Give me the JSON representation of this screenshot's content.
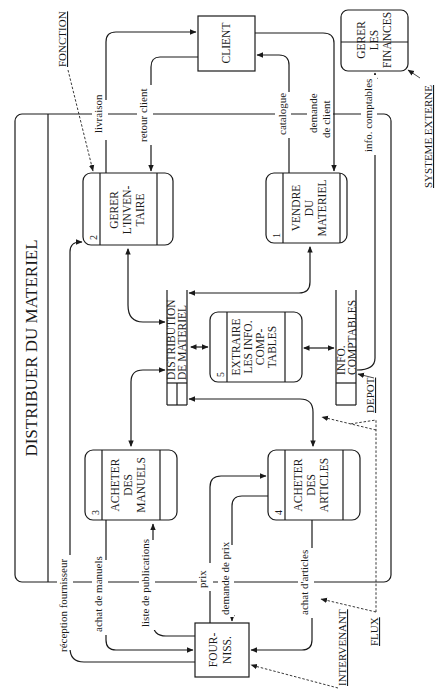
{
  "title": "DISTRIBUER DU MATERIEL",
  "entities": {
    "client": "CLIENT",
    "fournisseur": [
      "FOUR-",
      "NISS."
    ]
  },
  "external_process": [
    "GERER",
    "LES",
    "FINANCES"
  ],
  "processes": [
    {
      "num": "1",
      "lines": [
        "VENDRE",
        "DU",
        "MATERIEL"
      ]
    },
    {
      "num": "2",
      "lines": [
        "GERER",
        "L'INVEN-",
        "TAIRE"
      ]
    },
    {
      "num": "3",
      "lines": [
        "ACHETER",
        "DES",
        "MANUELS"
      ]
    },
    {
      "num": "4",
      "lines": [
        "ACHETER",
        "DES",
        "ARTICLES"
      ]
    },
    {
      "num": "5",
      "lines": [
        "EXTRAIRE",
        "LES INFO.",
        "COMP-",
        "TABLES"
      ]
    }
  ],
  "stores": {
    "distribution": [
      "DISTRIBUTION",
      "DE MATERIEL"
    ],
    "comptables": [
      "INFO.",
      "COMPTABLES"
    ]
  },
  "flows": {
    "livraison": "livraison",
    "retour_client": "retour client",
    "catalogue": "catalogue",
    "demande_client": [
      "demande",
      "de client"
    ],
    "info_comptables": "info. comptables",
    "reception_fournisseur": "réception fournisseur",
    "achat_manuels": "achat de manuels",
    "liste_publications": "liste de publications",
    "prix": "prix",
    "demande_prix": "demande de prix",
    "achat_articles": "achat d'articles"
  },
  "legend": {
    "fonction": "FONCTION",
    "systeme_externe": "SYSTEME EXTERNE",
    "depot": "DEPOT",
    "flux": "FLUX",
    "intervenant": "INTERVENANT"
  }
}
